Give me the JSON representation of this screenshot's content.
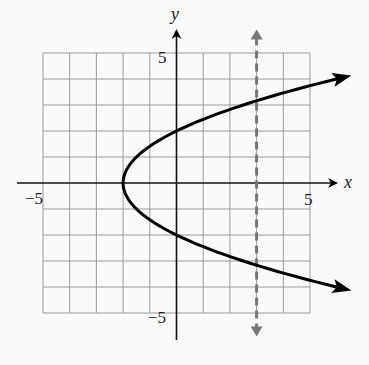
{
  "chart_data": {
    "type": "line",
    "title": "",
    "xlabel": "x",
    "ylabel": "y",
    "xlim": [
      -5,
      5
    ],
    "ylim": [
      -5,
      5
    ],
    "grid": true,
    "grid_step": 1,
    "tick_labels": {
      "x": [
        {
          "value": -5,
          "label": "−5"
        },
        {
          "value": 5,
          "label": "5"
        }
      ],
      "y": [
        {
          "value": 5,
          "label": "5"
        },
        {
          "value": -5,
          "label": "−5"
        }
      ]
    },
    "series": [
      {
        "name": "parabola",
        "equation": "x = y^2/2 - 2",
        "style": "solid",
        "color": "#000000",
        "vertex": [
          -2,
          0
        ],
        "y_intercepts": [
          2,
          -2
        ],
        "y_range": [
          -4.1,
          4.1
        ],
        "arrows": "both-ends"
      },
      {
        "name": "vertical-line-test",
        "equation": "x = 3",
        "style": "dashed",
        "color": "#777777",
        "x": 3,
        "y_range": [
          -5.9,
          5.9
        ],
        "arrows": "both-ends"
      }
    ]
  },
  "labels": {
    "x_axis": "x",
    "y_axis": "y",
    "x_min": "−5",
    "x_max": "5",
    "y_max": "5",
    "y_min": "−5"
  },
  "colors": {
    "background": "#fafafa",
    "grid": "#9a9a9a",
    "axis": "#111111",
    "curve": "#000000",
    "dashed": "#777777"
  }
}
